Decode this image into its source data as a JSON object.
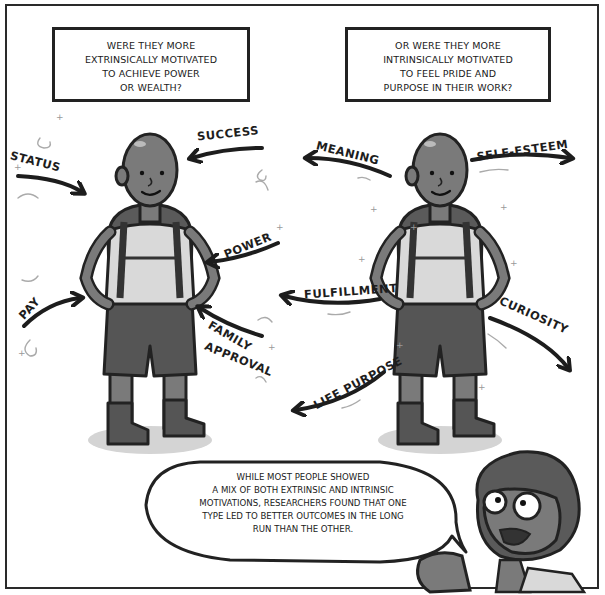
{
  "captions": {
    "left": {
      "lines": [
        "WERE THEY MORE",
        "EXTRINSICALLY MOTIVATED",
        "TO ACHIEVE POWER",
        "OR WEALTH?"
      ]
    },
    "right": {
      "lines": [
        "OR WERE THEY MORE",
        "INTRINSICALLY MOTIVATED",
        "TO FEEL PRIDE AND",
        "PURPOSE IN THEIR WORK?"
      ]
    }
  },
  "extrinsic_labels": {
    "success": "SUCCESS",
    "status": "STATUS",
    "power": "POWER",
    "pay": "PAY",
    "family": "FAMILY",
    "approval": "APPROVAL"
  },
  "intrinsic_labels": {
    "meaning": "MEANING",
    "self_esteem": "SELF-ESTEEM",
    "fulfillment": "FULFILLMENT",
    "curiosity": "CURIOSITY",
    "life_purpose": "LIFE PURPOSE"
  },
  "speech_bubble": {
    "lines": [
      "WHILE MOST PEOPLE SHOWED",
      "A MIX OF BOTH EXTRINSIC AND INTRINSIC",
      "MOTIVATIONS, RESEARCHERS FOUND THAT ONE",
      "TYPE LED TO BETTER OUTCOMES IN THE LONG",
      "RUN THAN THE OTHER."
    ]
  },
  "colors": {
    "ink": "#222222",
    "skin": "#7a7a7a",
    "shirt": "#d9d9d9",
    "shorts": "#555555",
    "shadow": "#d4d4d4"
  }
}
